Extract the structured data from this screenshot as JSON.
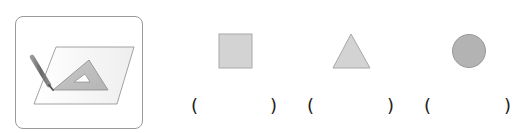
{
  "illustration": {
    "name": "drawing-with-set-square",
    "description": "pencil and set square on paper"
  },
  "shapes": [
    {
      "name": "square",
      "fill": "#d3d3d3",
      "stroke": "#a8a8a8"
    },
    {
      "name": "triangle",
      "fill": "#d3d3d3",
      "stroke": "#a8a8a8"
    },
    {
      "name": "circle",
      "fill": "#b3b3b3",
      "stroke": "#999999"
    }
  ],
  "answers": [
    {
      "open": "(",
      "close": ")",
      "value": ""
    },
    {
      "open": "(",
      "close": ")",
      "value": ""
    },
    {
      "open": "(",
      "close": ")",
      "value": ""
    }
  ],
  "colors": {
    "box_border": "#9a9a9a",
    "paren": "#222222"
  }
}
